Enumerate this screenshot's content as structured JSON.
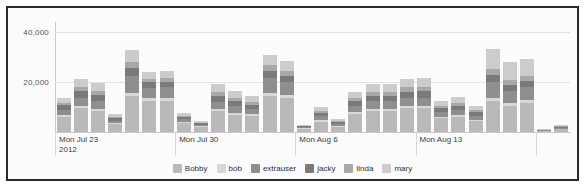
{
  "chart_data": {
    "type": "bar",
    "stacked": true,
    "title": "",
    "subtitle": "",
    "xlabel": "",
    "ylabel": "",
    "ylim": [
      0,
      44000
    ],
    "yticks": [
      20000,
      40000
    ],
    "ytick_labels": [
      "20,000",
      "40,000"
    ],
    "grid": true,
    "legend_position": "bottom",
    "axis_group_labels": [
      {
        "label": "Mon Jul 23",
        "sublabel": "2012",
        "at_index": 0
      },
      {
        "label": "Mon Jul 30",
        "sublabel": "",
        "at_index": 7
      },
      {
        "label": "Mon Aug 6",
        "sublabel": "",
        "at_index": 14
      },
      {
        "label": "Mon Aug 13",
        "sublabel": "",
        "at_index": 21
      },
      {
        "label": "",
        "sublabel": "",
        "at_index": 28
      }
    ],
    "categories": [
      "Mon Jul 23",
      "Tue Jul 24",
      "Wed Jul 25",
      "Thu Jul 26",
      "Fri Jul 27",
      "Sat Jul 28",
      "Sun Jul 29",
      "Mon Jul 30",
      "Tue Jul 31",
      "Wed Aug 1",
      "Thu Aug 2",
      "Fri Aug 3",
      "Sat Aug 4",
      "Sun Aug 5",
      "Mon Aug 6",
      "Tue Aug 7",
      "Wed Aug 8",
      "Thu Aug 9",
      "Fri Aug 10",
      "Sat Aug 11",
      "Sun Aug 12",
      "Mon Aug 13",
      "Tue Aug 14",
      "Wed Aug 15",
      "Thu Aug 16",
      "Fri Aug 17",
      "Sat Aug 18",
      "Sun Aug 19",
      "Mon Aug 20",
      "Tue Aug 21"
    ],
    "series": [
      {
        "name": "Bobby",
        "color": "#b9b9b9",
        "values": [
          6000,
          9500,
          8500,
          3200,
          14500,
          12500,
          12500,
          3800,
          2200,
          8500,
          7000,
          6500,
          14500,
          13500,
          1400,
          4200,
          2200,
          7200,
          8500,
          8500,
          9500,
          9500,
          5500,
          6000,
          4500,
          12500,
          10500,
          11500,
          500,
          1200
        ]
      },
      {
        "name": "bob",
        "color": "#d8d8d8",
        "values": [
          700,
          900,
          800,
          300,
          1200,
          1100,
          1100,
          400,
          200,
          900,
          800,
          700,
          1300,
          1200,
          150,
          500,
          250,
          800,
          900,
          900,
          1000,
          1000,
          600,
          700,
          500,
          1200,
          1100,
          1200,
          60,
          150
        ]
      },
      {
        "name": "extrauser",
        "color": "#8f8f8f",
        "values": [
          2200,
          3300,
          3100,
          1100,
          6800,
          4200,
          4300,
          1000,
          600,
          2800,
          2500,
          2100,
          5800,
          5200,
          400,
          1600,
          800,
          2400,
          2900,
          2900,
          3200,
          3300,
          1900,
          2200,
          1600,
          6200,
          4800,
          5200,
          150,
          400
        ]
      },
      {
        "name": "jacky",
        "color": "#7a7a7a",
        "values": [
          1800,
          2600,
          2400,
          900,
          3200,
          2100,
          2200,
          800,
          450,
          2200,
          2000,
          1700,
          3000,
          2700,
          320,
          1300,
          650,
          1900,
          2300,
          2300,
          2500,
          2600,
          1500,
          1700,
          1300,
          3100,
          2500,
          2700,
          120,
          300
        ]
      },
      {
        "name": "linda",
        "color": "#a8a8a8",
        "values": [
          900,
          1800,
          1700,
          600,
          2400,
          1500,
          1500,
          550,
          300,
          1600,
          1400,
          1200,
          2200,
          2000,
          220,
          900,
          450,
          1300,
          1600,
          1600,
          1800,
          1800,
          1000,
          1200,
          900,
          2300,
          1800,
          2000,
          80,
          220
        ]
      },
      {
        "name": "mary",
        "color": "#cccccc",
        "values": [
          2000,
          3300,
          3100,
          1100,
          4800,
          2800,
          2900,
          1000,
          580,
          3200,
          2700,
          2300,
          4200,
          3800,
          430,
          1700,
          880,
          2500,
          3000,
          3000,
          3300,
          3400,
          1900,
          2300,
          1700,
          7900,
          7400,
          6600,
          150,
          430
        ]
      }
    ],
    "totals": [
      13600,
      21400,
      19600,
      7200,
      32900,
      24200,
      24500,
      7550,
      4330,
      19200,
      16400,
      14500,
      31000,
      28400,
      2920,
      10200,
      5230,
      16100,
      19200,
      19200,
      21300,
      21600,
      12400,
      14100,
      10500,
      33200,
      28100,
      29200,
      1060,
      2700
    ]
  }
}
